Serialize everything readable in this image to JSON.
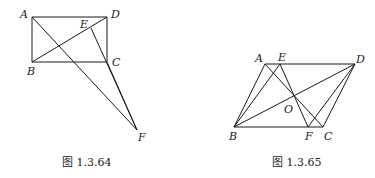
{
  "figures": [
    {
      "caption": "图 1.3.64",
      "points": {
        "A": [
          32,
          17
        ],
        "D": [
          107,
          17
        ],
        "B": [
          32,
          62
        ],
        "C": [
          107,
          62
        ],
        "E": [
          91,
          28
        ],
        "F": [
          137,
          130
        ]
      },
      "segments": [
        [
          "A",
          "D"
        ],
        [
          "D",
          "C"
        ],
        [
          "C",
          "B"
        ],
        [
          "B",
          "A"
        ],
        [
          "B",
          "D"
        ],
        [
          "A",
          "F"
        ],
        [
          "E",
          "F"
        ],
        [
          "C",
          "F"
        ]
      ],
      "labels": [
        {
          "text": "A",
          "x": 20,
          "y": 18
        },
        {
          "text": "D",
          "x": 111,
          "y": 18
        },
        {
          "text": "E",
          "x": 80,
          "y": 28
        },
        {
          "text": "B",
          "x": 27,
          "y": 75
        },
        {
          "text": "C",
          "x": 112,
          "y": 66
        },
        {
          "text": "F",
          "x": 138,
          "y": 141
        }
      ]
    },
    {
      "caption": "图 1.3.65",
      "points": {
        "A": [
          265,
          64
        ],
        "E": [
          280,
          64
        ],
        "D": [
          355,
          64
        ],
        "B": [
          234,
          127
        ],
        "F": [
          308,
          127
        ],
        "C": [
          323,
          127
        ],
        "O": [
          294,
          97
        ]
      },
      "segments": [
        [
          "A",
          "D"
        ],
        [
          "A",
          "B"
        ],
        [
          "B",
          "C"
        ],
        [
          "C",
          "D"
        ],
        [
          "B",
          "D"
        ],
        [
          "A",
          "C"
        ],
        [
          "B",
          "E"
        ],
        [
          "E",
          "F"
        ],
        [
          "D",
          "F"
        ]
      ],
      "labels": [
        {
          "text": "A",
          "x": 255,
          "y": 62
        },
        {
          "text": "E",
          "x": 278,
          "y": 61
        },
        {
          "text": "D",
          "x": 356,
          "y": 63
        },
        {
          "text": "O",
          "x": 284,
          "y": 113
        },
        {
          "text": "B",
          "x": 229,
          "y": 140
        },
        {
          "text": "F",
          "x": 305,
          "y": 140
        },
        {
          "text": "C",
          "x": 324,
          "y": 140
        }
      ]
    }
  ]
}
